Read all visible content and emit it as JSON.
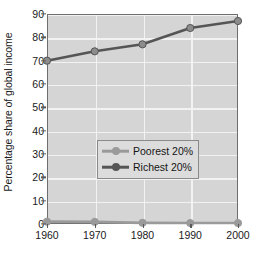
{
  "chart_data": {
    "type": "line",
    "title": "",
    "xlabel": "",
    "ylabel": "Percentage share of global income",
    "x": [
      1960,
      1970,
      1980,
      1990,
      2000
    ],
    "xtick_labels": [
      "1960",
      "1970",
      "1980",
      "1990",
      "2000"
    ],
    "ytick_labels": [
      "0",
      "10",
      "20",
      "30",
      "40",
      "50",
      "60",
      "70",
      "80",
      "90"
    ],
    "yticks": [
      0,
      10,
      20,
      30,
      40,
      50,
      60,
      70,
      80,
      90
    ],
    "ylim": [
      0,
      90
    ],
    "xlim": [
      1960,
      2000
    ],
    "grid": true,
    "legend_position": "center-left",
    "series": [
      {
        "name": "Poorest 20%",
        "values": [
          1.0,
          0.9,
          0.5,
          0.4,
          0.4
        ],
        "color": "#9a9a9a",
        "marker_color": "#9a9a9a"
      },
      {
        "name": "Richest 20%",
        "values": [
          70,
          74,
          77,
          84,
          87
        ],
        "color": "#555555",
        "marker_color": "#8c8c8c"
      }
    ],
    "plot_background": "#d5d5d5",
    "gridline_color": "#f2f2f2",
    "axis_color": "#6e6e6e",
    "figure_background": "#ffffff"
  },
  "legend": {
    "entries": [
      {
        "label": "Poorest 20%"
      },
      {
        "label": "Richest 20%"
      }
    ]
  }
}
